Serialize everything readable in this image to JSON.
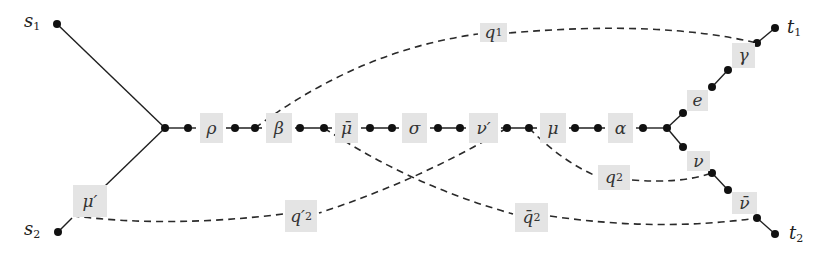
{
  "diagram": {
    "colors": {
      "background": "#ffffff",
      "edge": "#1f1f1f",
      "label_box": "#e4e4e4",
      "node": "#111111"
    },
    "terminals": [
      {
        "id": "s1",
        "text": "s",
        "sub": "1",
        "x": 24,
        "y": 14
      },
      {
        "id": "s2",
        "text": "s",
        "sub": "2",
        "x": 24,
        "y": 222
      },
      {
        "id": "t1",
        "text": "t",
        "sub": "1",
        "x": 787,
        "y": 20
      },
      {
        "id": "t2",
        "text": "t",
        "sub": "2",
        "x": 789,
        "y": 226
      }
    ],
    "edge_labels": [
      {
        "id": "rho",
        "text": "ρ",
        "x": 200,
        "y": 113,
        "w": 23,
        "h": 30
      },
      {
        "id": "beta",
        "text": "β",
        "x": 266,
        "y": 113,
        "w": 26,
        "h": 30
      },
      {
        "id": "mu-bar",
        "text": "μ̄",
        "x": 335,
        "y": 113,
        "w": 23,
        "h": 30
      },
      {
        "id": "sigma",
        "text": "σ",
        "x": 402,
        "y": 113,
        "w": 25,
        "h": 30
      },
      {
        "id": "nu-prime",
        "text": "ν′",
        "x": 469,
        "y": 113,
        "w": 29,
        "h": 30
      },
      {
        "id": "mu",
        "text": "μ",
        "x": 540,
        "y": 113,
        "w": 26,
        "h": 30
      },
      {
        "id": "alpha",
        "text": "α",
        "x": 608,
        "y": 113,
        "w": 25,
        "h": 30
      },
      {
        "id": "e",
        "text": "e",
        "x": 687,
        "y": 90,
        "w": 21,
        "h": 21
      },
      {
        "id": "gamma",
        "text": "γ",
        "x": 732,
        "y": 43,
        "w": 23,
        "h": 25
      },
      {
        "id": "nu",
        "text": "ν",
        "x": 687,
        "y": 151,
        "w": 23,
        "h": 20
      },
      {
        "id": "nu-bar",
        "text": "ν̄",
        "x": 732,
        "y": 192,
        "w": 25,
        "h": 22
      },
      {
        "id": "mu-prime",
        "text": "μ′",
        "x": 73,
        "y": 185,
        "w": 34,
        "h": 32
      }
    ],
    "demand_labels": [
      {
        "id": "q1",
        "text": "q",
        "sub": "1",
        "x": 480,
        "y": 23,
        "w": 27,
        "h": 19
      },
      {
        "id": "q2-prime",
        "text": "q′",
        "sub": "2",
        "x": 285,
        "y": 200,
        "w": 32,
        "h": 32
      },
      {
        "id": "q2",
        "text": "q",
        "sub": "2",
        "x": 598,
        "y": 165,
        "w": 32,
        "h": 25
      },
      {
        "id": "q2-bar",
        "text": "q̄",
        "sub": "2",
        "x": 515,
        "y": 203,
        "w": 33,
        "h": 29
      }
    ],
    "nodes": [
      [
        57,
        24
      ],
      [
        58,
        232
      ],
      [
        165,
        128
      ],
      [
        188,
        128
      ],
      [
        235,
        128
      ],
      [
        255,
        128
      ],
      [
        300,
        128
      ],
      [
        324,
        128
      ],
      [
        370,
        128
      ],
      [
        392,
        128
      ],
      [
        438,
        128
      ],
      [
        460,
        128
      ],
      [
        507,
        128
      ],
      [
        529,
        128
      ],
      [
        575,
        128
      ],
      [
        598,
        128
      ],
      [
        643,
        128
      ],
      [
        667,
        128
      ],
      [
        683,
        113
      ],
      [
        712,
        87
      ],
      [
        728,
        70
      ],
      [
        757,
        43
      ],
      [
        775,
        28
      ],
      [
        683,
        147
      ],
      [
        712,
        173
      ],
      [
        728,
        190
      ],
      [
        757,
        218
      ],
      [
        775,
        234
      ]
    ]
  }
}
